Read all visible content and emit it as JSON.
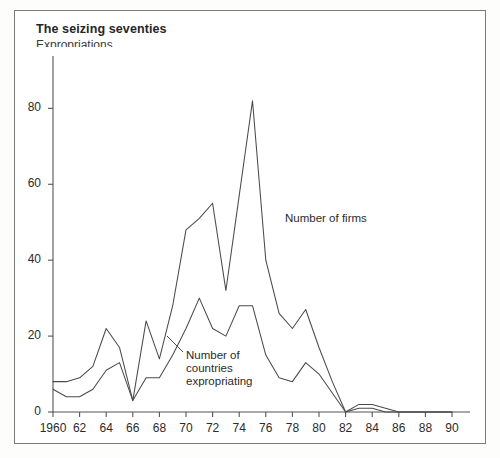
{
  "figure": {
    "title": "The seizing seventies",
    "subtitle": "Expropriations",
    "background": "#ffffff",
    "frame_color": "#7b7b7b",
    "line_color": "#4a4a4a"
  },
  "annotations": [
    {
      "name": "firms-label",
      "text": "Number of firms",
      "x": 285,
      "y": 212
    },
    {
      "name": "countries-label",
      "text": "Number of\ncountries\nexpropriating",
      "x": 186,
      "y": 349
    }
  ],
  "chart_data": {
    "type": "line",
    "title": "The seizing seventies",
    "subtitle": "Expropriations",
    "xlabel": "",
    "ylabel": "",
    "xlim": [
      1960,
      1990
    ],
    "ylim": [
      0,
      88
    ],
    "yticks": [
      0,
      20,
      40,
      60,
      80
    ],
    "ytick_labels": [
      "0",
      "20",
      "40",
      "60",
      "80"
    ],
    "xticks": [
      1960,
      1962,
      1964,
      1966,
      1968,
      1970,
      1972,
      1974,
      1976,
      1978,
      1980,
      1982,
      1984,
      1986,
      1988,
      1990
    ],
    "xtick_labels": [
      "1960",
      "62",
      "64",
      "66",
      "68",
      "70",
      "72",
      "74",
      "76",
      "78",
      "80",
      "82",
      "84",
      "86",
      "88",
      "90"
    ],
    "minor_xticks_every": 1,
    "grid": false,
    "legend": "inline-annotations",
    "x": [
      1960,
      1961,
      1962,
      1963,
      1964,
      1965,
      1966,
      1967,
      1968,
      1969,
      1970,
      1971,
      1972,
      1973,
      1974,
      1975,
      1976,
      1977,
      1978,
      1979,
      1980,
      1981,
      1982,
      1983,
      1984,
      1985,
      1986,
      1987,
      1988,
      1989,
      1990
    ],
    "series": [
      {
        "name": "Number of firms",
        "values": [
          8,
          8,
          9,
          12,
          22,
          17,
          3,
          24,
          14,
          28,
          48,
          51,
          55,
          32,
          57,
          82,
          40,
          26,
          22,
          27,
          17,
          8,
          0,
          2,
          2,
          1,
          0,
          0,
          0,
          0,
          0
        ]
      },
      {
        "name": "Number of countries expropriating",
        "values": [
          6,
          4,
          4,
          6,
          11,
          13,
          3,
          9,
          9,
          15,
          22,
          30,
          22,
          20,
          28,
          28,
          15,
          9,
          8,
          13,
          10,
          5,
          0,
          1,
          1,
          0,
          0,
          0,
          0,
          0,
          0
        ]
      }
    ]
  }
}
